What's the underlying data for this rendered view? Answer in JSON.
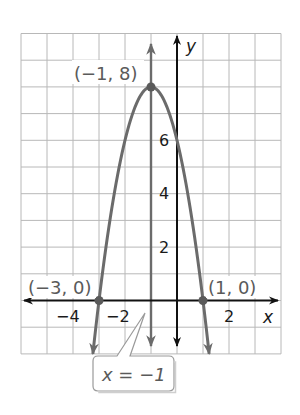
{
  "chart_data": {
    "type": "line",
    "title": "",
    "function": "y = -2(x + 1)^2 + 8",
    "xlabel": "x",
    "ylabel": "y",
    "xlim": [
      -6,
      4
    ],
    "ylim": [
      -2,
      10
    ],
    "grid": true,
    "x_ticks": [
      {
        "value": -4,
        "label": "−4"
      },
      {
        "value": -2,
        "label": "−2"
      },
      {
        "value": 2,
        "label": "2"
      }
    ],
    "y_ticks": [
      {
        "value": 2,
        "label": "2"
      },
      {
        "value": 4,
        "label": "4"
      },
      {
        "value": 6,
        "label": "6"
      }
    ],
    "series": [
      {
        "name": "parabola",
        "x": [
          -3.236,
          -3,
          -2.5,
          -2,
          -1.5,
          -1,
          -0.5,
          0,
          0.5,
          1,
          1.236
        ],
        "y": [
          -2,
          0,
          3.5,
          6,
          7.5,
          8,
          7.5,
          6,
          3.5,
          0,
          -2
        ]
      }
    ],
    "labeled_points": [
      {
        "x": -1,
        "y": 8,
        "label": "(−1, 8)"
      },
      {
        "x": -3,
        "y": 0,
        "label": "(−3, 0)"
      },
      {
        "x": 1,
        "y": 0,
        "label": "(1, 0)"
      }
    ],
    "axis_of_symmetry": {
      "x": -1,
      "label": "x = −1"
    },
    "colors": {
      "curve": "#6b6b6b",
      "axes": "#111111",
      "grid": "#b8b8b8",
      "point_labels": "#5a5a5a"
    }
  }
}
